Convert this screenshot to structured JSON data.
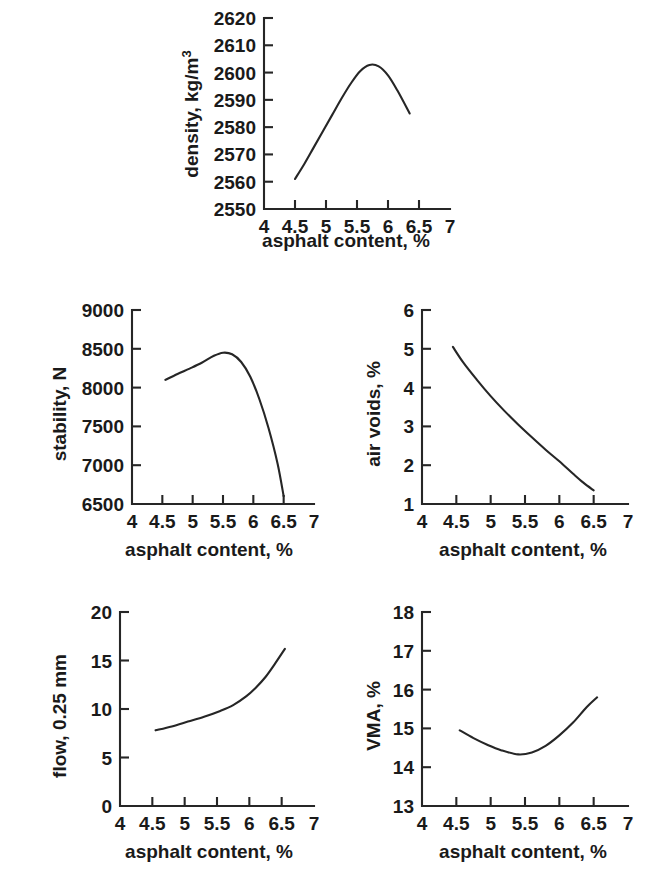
{
  "figure": {
    "background": "#ffffff",
    "ink_color": "#262626",
    "caption": "",
    "shared_xlabel": "asphalt content, %"
  },
  "chart_data": [
    {
      "id": "density",
      "type": "line",
      "title": "",
      "xlabel": "asphalt content, %",
      "ylabel": "density, kg/m³",
      "ylabel_base": "density, kg/m",
      "ylabel_exponent": "3",
      "xlim": [
        4,
        7
      ],
      "ylim": [
        2550,
        2620
      ],
      "xticks": [
        4,
        4.5,
        5,
        5.5,
        6,
        6.5,
        7
      ],
      "xticklabels": [
        "4",
        "4.5",
        "5",
        "5.5",
        "6",
        "6.5",
        "7"
      ],
      "yticks": [
        2550,
        2560,
        2570,
        2580,
        2590,
        2600,
        2610,
        2620
      ],
      "yticklabels": [
        "2550",
        "2560",
        "2570",
        "2580",
        "2590",
        "2600",
        "2610",
        "2620"
      ],
      "grid": false,
      "legend": false,
      "x": [
        4.5,
        4.65,
        4.8,
        4.95,
        5.1,
        5.25,
        5.4,
        5.55,
        5.7,
        5.85,
        6.0,
        6.15,
        6.35
      ],
      "values": [
        2561.0,
        2566.5,
        2572.5,
        2578.5,
        2584.5,
        2590.5,
        2596.0,
        2600.5,
        2602.8,
        2602.3,
        2599.0,
        2593.5,
        2585.0
      ]
    },
    {
      "id": "stability",
      "type": "line",
      "title": "",
      "xlabel": "asphalt content, %",
      "ylabel": "stability, N",
      "xlim": [
        4,
        7
      ],
      "ylim": [
        6500,
        9000
      ],
      "xticks": [
        4,
        4.5,
        5,
        5.5,
        6,
        6.5,
        7
      ],
      "xticklabels": [
        "4",
        "4.5",
        "5",
        "5.5",
        "6",
        "6.5",
        "7"
      ],
      "yticks": [
        6500,
        7000,
        7500,
        8000,
        8500,
        9000
      ],
      "yticklabels": [
        "6500",
        "7000",
        "7500",
        "8000",
        "8500",
        "9000"
      ],
      "grid": false,
      "legend": false,
      "x": [
        4.55,
        4.75,
        4.95,
        5.15,
        5.35,
        5.5,
        5.65,
        5.8,
        5.95,
        6.1,
        6.25,
        6.4,
        6.5
      ],
      "values": [
        8100,
        8175,
        8245,
        8320,
        8410,
        8450,
        8430,
        8330,
        8140,
        7850,
        7480,
        7020,
        6600
      ]
    },
    {
      "id": "air-voids",
      "type": "line",
      "title": "",
      "xlabel": "asphalt content, %",
      "ylabel": "air voids, %",
      "xlim": [
        4,
        7
      ],
      "ylim": [
        1,
        6
      ],
      "xticks": [
        4,
        4.5,
        5,
        5.5,
        6,
        6.5,
        7
      ],
      "xticklabels": [
        "4",
        "4.5",
        "5",
        "5.5",
        "6",
        "6.5",
        "7"
      ],
      "yticks": [
        1,
        2,
        3,
        4,
        5,
        6
      ],
      "yticklabels": [
        "1",
        "2",
        "3",
        "4",
        "5",
        "6"
      ],
      "grid": false,
      "legend": false,
      "x": [
        4.45,
        4.6,
        4.8,
        5.0,
        5.2,
        5.4,
        5.6,
        5.8,
        6.0,
        6.2,
        6.35,
        6.5
      ],
      "values": [
        5.05,
        4.65,
        4.2,
        3.78,
        3.4,
        3.05,
        2.72,
        2.4,
        2.1,
        1.78,
        1.55,
        1.35
      ]
    },
    {
      "id": "flow",
      "type": "line",
      "title": "",
      "xlabel": "asphalt content, %",
      "ylabel": "flow, 0.25 mm",
      "xlim": [
        4,
        7
      ],
      "ylim": [
        0,
        20
      ],
      "xticks": [
        4,
        4.5,
        5,
        5.5,
        6,
        6.5,
        7
      ],
      "xticklabels": [
        "4",
        "4.5",
        "5",
        "5.5",
        "6",
        "6.5",
        "7"
      ],
      "yticks": [
        0,
        5,
        10,
        15,
        20
      ],
      "yticklabels": [
        "0",
        "5",
        "10",
        "15",
        "20"
      ],
      "grid": false,
      "legend": false,
      "x": [
        4.55,
        4.8,
        5.05,
        5.3,
        5.55,
        5.75,
        5.95,
        6.1,
        6.25,
        6.4,
        6.55
      ],
      "values": [
        7.8,
        8.2,
        8.7,
        9.2,
        9.8,
        10.4,
        11.3,
        12.2,
        13.3,
        14.7,
        16.2
      ]
    },
    {
      "id": "vma",
      "type": "line",
      "title": "",
      "xlabel": "asphalt content, %",
      "ylabel": "VMA, %",
      "xlim": [
        4,
        7
      ],
      "ylim": [
        13,
        18
      ],
      "xticks": [
        4,
        4.5,
        5,
        5.5,
        6,
        6.5,
        7
      ],
      "xticklabels": [
        "4",
        "4.5",
        "5",
        "5.5",
        "6",
        "6.5",
        "7"
      ],
      "yticks": [
        13,
        14,
        15,
        16,
        17,
        18
      ],
      "yticklabels": [
        "13",
        "14",
        "15",
        "16",
        "17",
        "18"
      ],
      "grid": false,
      "legend": false,
      "x": [
        4.55,
        4.75,
        4.95,
        5.15,
        5.4,
        5.6,
        5.8,
        6.0,
        6.2,
        6.4,
        6.55
      ],
      "values": [
        14.95,
        14.75,
        14.58,
        14.44,
        14.33,
        14.38,
        14.55,
        14.82,
        15.15,
        15.55,
        15.8
      ]
    }
  ]
}
